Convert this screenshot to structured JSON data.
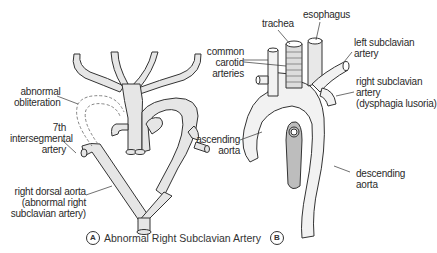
{
  "figure_a": {
    "marker": "A",
    "caption": "Abnormal Right Subclavian Artery",
    "labels": {
      "abnormal_obliteration": [
        "abnormal",
        "obliteration"
      ],
      "intersegmental": [
        "7th",
        "intersegmental",
        "artery"
      ],
      "right_dorsal_aorta": [
        "right dorsal aorta",
        "(abnormal right",
        "subclavian artery)"
      ]
    }
  },
  "figure_b": {
    "marker": "B",
    "labels": {
      "trachea": "trachea",
      "esophagus": "esophagus",
      "common_carotid": [
        "common",
        "carotid",
        "arteries"
      ],
      "left_subclavian": [
        "left subclavian",
        "artery"
      ],
      "right_subclavian": [
        "right subclavian",
        "artery",
        "(dysphagia lusoria)"
      ],
      "ascending_aorta": [
        "ascending",
        "aorta"
      ],
      "descending_aorta": [
        "descending",
        "aorta"
      ]
    }
  },
  "colors": {
    "vessel_fill": "#e6e6e6",
    "outline": "#333333",
    "dashed": "#777777"
  }
}
